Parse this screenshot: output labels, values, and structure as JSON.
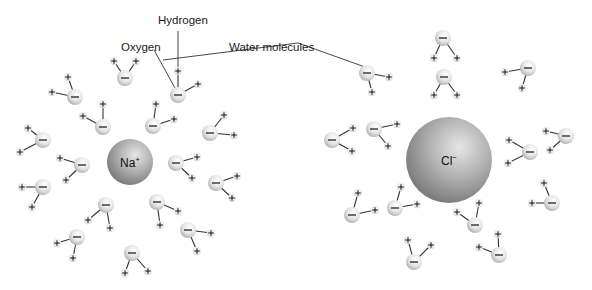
{
  "labels": {
    "hydrogen": "Hydrogen",
    "oxygen": "Oxygen",
    "water_molecules": "Water molecules"
  },
  "ions": [
    {
      "name": "sodium-ion",
      "symbol": "Na",
      "charge": "+",
      "cx": 130,
      "cy": 162,
      "r": 23
    },
    {
      "name": "chloride-ion",
      "symbol": "Cl",
      "charge": "−",
      "cx": 449,
      "cy": 160,
      "r": 43
    }
  ],
  "atom_signs": {
    "oxygen": "−",
    "hydrogen": "+"
  },
  "colors": {
    "ion_light": "#d8d8d8",
    "ion_dark": "#7a7a7a",
    "oxygen_light": "#ffffff",
    "oxygen_dark": "#a9a9a9",
    "bond": "#333333",
    "leader_line": "#333333"
  },
  "molecules": [
    {
      "o": [
        125,
        78
      ],
      "h": [
        [
          114,
          61
        ],
        [
          136,
          61
        ]
      ]
    },
    {
      "o": [
        178,
        95
      ],
      "h": [
        [
          178,
          71
        ],
        [
          198,
          84
        ]
      ]
    },
    {
      "o": [
        75,
        97
      ],
      "h": [
        [
          68,
          77
        ],
        [
          52,
          92
        ]
      ]
    },
    {
      "o": [
        103,
        127
      ],
      "h": [
        [
          103,
          104
        ],
        [
          83,
          116
        ]
      ]
    },
    {
      "o": [
        153,
        126
      ],
      "h": [
        [
          156,
          104
        ],
        [
          174,
          119
        ]
      ]
    },
    {
      "o": [
        210,
        133
      ],
      "h": [
        [
          224,
          115
        ],
        [
          234,
          135
        ]
      ]
    },
    {
      "o": [
        43,
        140
      ],
      "h": [
        [
          28,
          128
        ],
        [
          20,
          152
        ]
      ]
    },
    {
      "o": [
        43,
        187
      ],
      "h": [
        [
          22,
          187
        ],
        [
          32,
          207
        ]
      ]
    },
    {
      "o": [
        82,
        165
      ],
      "h": [
        [
          60,
          158
        ],
        [
          66,
          180
        ]
      ]
    },
    {
      "o": [
        176,
        163
      ],
      "h": [
        [
          197,
          157
        ],
        [
          192,
          178
        ]
      ]
    },
    {
      "o": [
        216,
        183
      ],
      "h": [
        [
          237,
          176
        ],
        [
          232,
          198
        ]
      ]
    },
    {
      "o": [
        106,
        205
      ],
      "h": [
        [
          88,
          220
        ],
        [
          110,
          228
        ]
      ]
    },
    {
      "o": [
        157,
        202
      ],
      "h": [
        [
          160,
          225
        ],
        [
          178,
          211
        ]
      ]
    },
    {
      "o": [
        188,
        230
      ],
      "h": [
        [
          211,
          233
        ],
        [
          197,
          251
        ]
      ]
    },
    {
      "o": [
        77,
        237
      ],
      "h": [
        [
          57,
          243
        ],
        [
          73,
          258
        ]
      ]
    },
    {
      "o": [
        132,
        253
      ],
      "h": [
        [
          125,
          273
        ],
        [
          148,
          271
        ]
      ]
    },
    {
      "o": [
        443,
        38
      ],
      "h": [
        [
          434,
          58
        ],
        [
          457,
          58
        ]
      ]
    },
    {
      "o": [
        367,
        73
      ],
      "h": [
        [
          389,
          77
        ],
        [
          372,
          92
        ]
      ]
    },
    {
      "o": [
        444,
        77
      ],
      "h": [
        [
          434,
          95
        ],
        [
          457,
          95
        ]
      ]
    },
    {
      "o": [
        528,
        68
      ],
      "h": [
        [
          505,
          72
        ],
        [
          522,
          88
        ]
      ]
    },
    {
      "o": [
        332,
        140
      ],
      "h": [
        [
          353,
          128
        ],
        [
          352,
          151
        ]
      ]
    },
    {
      "o": [
        374,
        129
      ],
      "h": [
        [
          397,
          124
        ],
        [
          388,
          146
        ]
      ]
    },
    {
      "o": [
        530,
        152
      ],
      "h": [
        [
          509,
          140
        ],
        [
          508,
          163
        ]
      ]
    },
    {
      "o": [
        566,
        136
      ],
      "h": [
        [
          546,
          131
        ],
        [
          550,
          150
        ]
      ]
    },
    {
      "o": [
        352,
        215
      ],
      "h": [
        [
          358,
          193
        ],
        [
          375,
          210
        ]
      ]
    },
    {
      "o": [
        395,
        208
      ],
      "h": [
        [
          401,
          187
        ],
        [
          417,
          204
        ]
      ]
    },
    {
      "o": [
        475,
        225
      ],
      "h": [
        [
          457,
          212
        ],
        [
          479,
          203
        ]
      ]
    },
    {
      "o": [
        552,
        203
      ],
      "h": [
        [
          544,
          183
        ],
        [
          532,
          203
        ]
      ]
    },
    {
      "o": [
        414,
        262
      ],
      "h": [
        [
          408,
          240
        ],
        [
          431,
          245
        ]
      ]
    },
    {
      "o": [
        499,
        255
      ],
      "h": [
        [
          498,
          234
        ],
        [
          479,
          247
        ]
      ]
    }
  ],
  "leaders": {
    "hydrogen": [
      [
        178,
        31
      ],
      [
        178,
        69
      ]
    ],
    "oxygen": [
      [
        154,
        50
      ],
      [
        175,
        88
      ]
    ],
    "water_molecules": [
      [
        163,
        60
      ],
      [
        298,
        43
      ],
      [
        365,
        67
      ]
    ]
  }
}
